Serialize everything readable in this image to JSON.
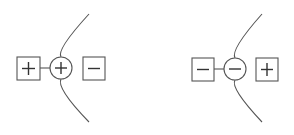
{
  "diagram": {
    "type": "charge-interface-schematic",
    "panels": [
      {
        "id": "left",
        "left_box": {
          "symbol": "+"
        },
        "center_circle": {
          "symbol": "+"
        },
        "right_box": {
          "symbol": "−"
        },
        "connector": "line from left box to circle",
        "boundary": "curved arc passing through circle"
      },
      {
        "id": "right",
        "left_box": {
          "symbol": "−"
        },
        "center_circle": {
          "symbol": "−"
        },
        "right_box": {
          "symbol": "+"
        },
        "connector": "line from left box to circle",
        "boundary": "curved arc passing through circle"
      }
    ],
    "colors": {
      "line": "#555555",
      "symbol": "#333333",
      "background": "#ffffff"
    }
  }
}
